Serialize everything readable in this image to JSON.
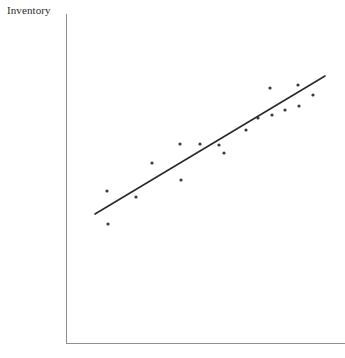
{
  "figure": {
    "width": 345,
    "height": 358,
    "background_color": "#ffffff"
  },
  "labels": {
    "y_axis_label": "Inventory",
    "x_axis_label": "",
    "title": ""
  },
  "axes": {
    "axis_color": "#8f8f8f",
    "y_axis": {
      "x": 66,
      "y_top": 14,
      "y_bottom": 343
    },
    "x_axis": {
      "y": 343,
      "x_left": 66,
      "x_right": 345
    },
    "ticks_visible": false,
    "tick_labels_visible": false,
    "grid": false
  },
  "chart_data": {
    "type": "scatter",
    "title": "",
    "xlabel": "",
    "ylabel": "Inventory",
    "grid": false,
    "legend": false,
    "xlim": [
      0,
      10
    ],
    "ylim": [
      0,
      10
    ],
    "point_color": "#3a3a3a",
    "point_radius_px": 1.6,
    "points_px": [
      {
        "x": 107,
        "y": 191
      },
      {
        "x": 108,
        "y": 224
      },
      {
        "x": 136,
        "y": 197
      },
      {
        "x": 152,
        "y": 163
      },
      {
        "x": 181,
        "y": 180
      },
      {
        "x": 180,
        "y": 144
      },
      {
        "x": 200,
        "y": 144
      },
      {
        "x": 219,
        "y": 145
      },
      {
        "x": 224,
        "y": 153
      },
      {
        "x": 246,
        "y": 130
      },
      {
        "x": 258,
        "y": 118
      },
      {
        "x": 270,
        "y": 88
      },
      {
        "x": 272,
        "y": 115
      },
      {
        "x": 285,
        "y": 110
      },
      {
        "x": 298,
        "y": 85
      },
      {
        "x": 299,
        "y": 106
      },
      {
        "x": 313,
        "y": 95
      }
    ],
    "trend_line": {
      "visible": true,
      "color": "#2a2a2a",
      "x1": 95,
      "y1": 214,
      "x2": 325,
      "y2": 76
    }
  }
}
